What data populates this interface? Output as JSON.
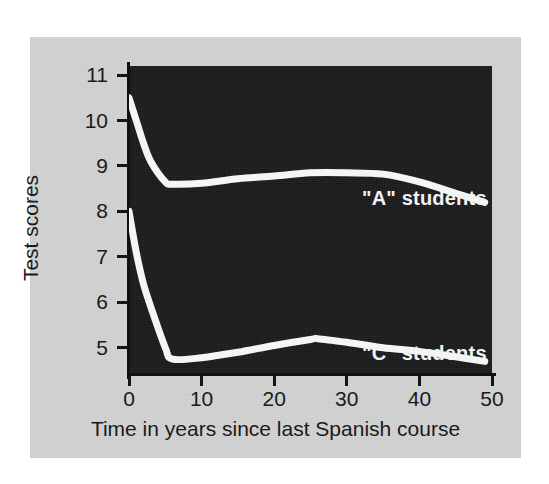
{
  "figure": {
    "panel_color": "#d2d2d2",
    "plot_background": "#1c1b1b",
    "line_color": "#f5f5f5",
    "axis_color": "#141414"
  },
  "axes": {
    "y_title": "Test scores",
    "x_title": "Time in years since last Spanish course",
    "y_ticks": [
      "11",
      "10",
      "9",
      "8",
      "7",
      "6",
      "5"
    ],
    "x_ticks": [
      "0",
      "10",
      "20",
      "30",
      "40",
      "50"
    ]
  },
  "series_labels": {
    "a": "\"A\" students",
    "c": "\"C\" students"
  },
  "chart_data": {
    "type": "line",
    "title": "",
    "xlabel": "Time in years since last Spanish course",
    "ylabel": "Test scores",
    "xlim": [
      0,
      50
    ],
    "ylim": [
      4.4,
      11.2
    ],
    "xticks": [
      0,
      10,
      20,
      30,
      40,
      50
    ],
    "yticks": [
      5,
      6,
      7,
      8,
      9,
      10,
      11
    ],
    "grid": false,
    "legend": "inline-annotations",
    "background": "#1c1b1b",
    "series": [
      {
        "name": "\"A\" students",
        "color": "#f5f5f5",
        "x": [
          0,
          1,
          2,
          3,
          5,
          6,
          10,
          15,
          20,
          25,
          30,
          35,
          40,
          45,
          49
        ],
        "values": [
          10.5,
          10.0,
          9.5,
          9.1,
          8.65,
          8.6,
          8.62,
          8.72,
          8.78,
          8.85,
          8.85,
          8.82,
          8.65,
          8.4,
          8.2
        ]
      },
      {
        "name": "\"C\" students",
        "color": "#f5f5f5",
        "x": [
          0,
          1,
          2,
          3,
          5,
          6,
          10,
          15,
          20,
          25,
          26,
          30,
          35,
          40,
          45,
          49
        ],
        "values": [
          8.0,
          7.1,
          6.4,
          5.9,
          5.0,
          4.75,
          4.78,
          4.9,
          5.05,
          5.18,
          5.2,
          5.12,
          5.0,
          4.92,
          4.8,
          4.7
        ]
      }
    ]
  }
}
